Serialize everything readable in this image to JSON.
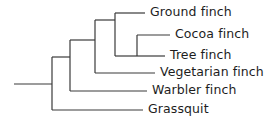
{
  "figure": {
    "kind": "cladogram",
    "background_color": "#ffffff",
    "line_color": "#3a3a3a",
    "text_color": "#1d1d1d",
    "line_width": 1.2,
    "width": 267,
    "height": 122
  },
  "taxa": [
    {
      "id": "ground-finch",
      "label": "Ground finch",
      "row_y": 13,
      "tip_x": 145,
      "label_x": 150
    },
    {
      "id": "cocoa-finch",
      "label": "Cocoa finch",
      "row_y": 35,
      "tip_x": 170,
      "label_x": 175
    },
    {
      "id": "tree-finch",
      "label": "Tree finch",
      "row_y": 56,
      "tip_x": 165,
      "label_x": 170
    },
    {
      "id": "vegetarian-finch",
      "label": "Vegetarian finch",
      "row_y": 73,
      "tip_x": 155,
      "label_x": 160
    },
    {
      "id": "warbler-finch",
      "label": "Warbler finch",
      "row_y": 91,
      "tip_x": 147,
      "label_x": 152
    },
    {
      "id": "grassquit",
      "label": "Grassquit",
      "row_y": 110,
      "tip_x": 143,
      "label_x": 148
    }
  ],
  "nodes": [
    {
      "id": "root",
      "x": 52,
      "top_y": 57,
      "bottom_y": 110
    },
    {
      "id": "finch-clade",
      "x": 70,
      "top_y": 40,
      "bottom_y": 91
    },
    {
      "id": "non-warbler",
      "x": 95,
      "top_y": 20,
      "bottom_y": 73
    },
    {
      "id": "ground-tree-cla",
      "x": 115,
      "top_y": 13,
      "bottom_y": 56
    },
    {
      "id": "cocoa-tree",
      "x": 137,
      "top_y": 35,
      "bottom_y": 56
    }
  ],
  "connectors": [
    {
      "id": "root-stem",
      "from_x": 14,
      "to_x": 52,
      "y": 84
    },
    {
      "id": "root-to-finch-clade",
      "from_x": 52,
      "to_x": 70,
      "y": 57
    },
    {
      "id": "finch-to-nonwarbler",
      "from_x": 70,
      "to_x": 95,
      "y": 40
    },
    {
      "id": "nonwarbler-to-ground",
      "from_x": 95,
      "to_x": 115,
      "y": 20
    },
    {
      "id": "ground-clade-to-tree",
      "from_x": 115,
      "to_x": 137,
      "y": 56
    }
  ]
}
